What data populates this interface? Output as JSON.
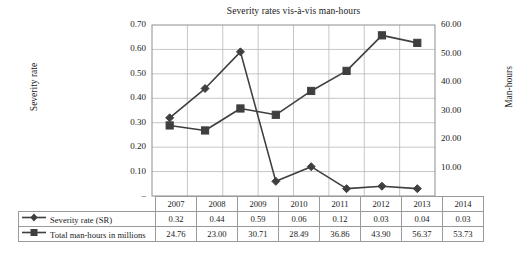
{
  "chart_data": {
    "type": "line",
    "title": "Severity rates vis-à-vis man-hours",
    "xlabel": "",
    "categories": [
      "2007",
      "2008",
      "2009",
      "2010",
      "2011",
      "2012",
      "2013",
      "2014"
    ],
    "series": [
      {
        "name": "Severity rate (SR)",
        "axis": "left",
        "marker": "diamond",
        "color": "#3f3f3f",
        "values": [
          0.32,
          0.44,
          0.59,
          0.06,
          0.12,
          0.03,
          0.04,
          0.03
        ]
      },
      {
        "name": "Total man-hours in millions",
        "axis": "right",
        "marker": "square",
        "color": "#3f3f3f",
        "values": [
          24.76,
          23.0,
          30.71,
          28.49,
          36.86,
          43.9,
          56.37,
          53.73
        ]
      }
    ],
    "left_axis": {
      "label": "Severity rate",
      "ylim": [
        0.0,
        0.7
      ],
      "ticks": [
        0.0,
        0.1,
        0.2,
        0.3,
        0.4,
        0.5,
        0.6,
        0.7
      ],
      "tick_labels": [
        "–",
        "0.10",
        "0.20",
        "0.30",
        "0.40",
        "0.50",
        "0.60",
        "0.70"
      ]
    },
    "right_axis": {
      "label": "Man-hours",
      "ylim": [
        0.0,
        60.0
      ],
      "ticks": [
        0.0,
        10.0,
        20.0,
        30.0,
        40.0,
        50.0,
        60.0
      ],
      "tick_labels": [
        "–",
        "10.00",
        "20.00",
        "30.00",
        "40.00",
        "50.00",
        "60.00"
      ]
    },
    "grid": true,
    "legend_position": "table-below"
  },
  "table": {
    "corner_label": "",
    "year_headers": [
      "2007",
      "2008",
      "2009",
      "2010",
      "2011",
      "2012",
      "2013",
      "2014"
    ],
    "rows": [
      {
        "label": "Severity rate (SR)",
        "marker": "diamond",
        "values": [
          "0.32",
          "0.44",
          "0.59",
          "0.06",
          "0.12",
          "0.03",
          "0.04",
          "0.03"
        ]
      },
      {
        "label": "Total man-hours in millions",
        "marker": "square",
        "values": [
          "24.76",
          "23.00",
          "30.71",
          "28.49",
          "36.86",
          "43.90",
          "56.37",
          "53.73"
        ]
      }
    ]
  },
  "colors": {
    "series_line": "#3f3f3f",
    "grid": "#b7b7b7",
    "axis": "#5a5a5a",
    "text": "#1a1a1a"
  }
}
